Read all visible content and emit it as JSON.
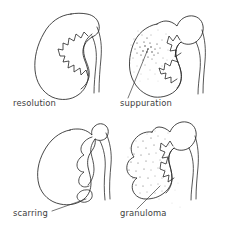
{
  "figure": {
    "background_color": "#ffffff",
    "ink_color": "#262626",
    "stipple_color": "#4a4a4a",
    "width": 228,
    "height": 232,
    "columns": 2,
    "rows": 2
  },
  "panels": [
    {
      "id": "resolution",
      "label": "resolution",
      "position": "top-left",
      "label_x": 13,
      "label_y": 106,
      "outline_style": "smooth",
      "stippling": "none",
      "leader_line": false,
      "description": "normal smooth bean-shaped kidney with sharp cupped calyces"
    },
    {
      "id": "suppuration",
      "label": "suppuration",
      "position": "top-right",
      "label_x": 120,
      "label_y": 106,
      "outline_style": "smooth-bulging",
      "stippling": "focal-dense-cluster",
      "leader_line": true,
      "description": "kidney with dense radiating abscess cluster in upper pole"
    },
    {
      "id": "scarring",
      "label": "scarring",
      "position": "bottom-left",
      "label_x": 13,
      "label_y": 216,
      "outline_style": "indented",
      "stippling": "none",
      "leader_line": true,
      "description": "deformed kidney with blunted clubbed calyces and cortical indentation"
    },
    {
      "id": "granuloma",
      "label": "granuloma",
      "position": "bottom-right",
      "label_x": 120,
      "label_y": 216,
      "outline_style": "lobulated",
      "stippling": "diffuse",
      "leader_line": true,
      "description": "lobulated kidney with widespread diffuse stippling"
    }
  ]
}
